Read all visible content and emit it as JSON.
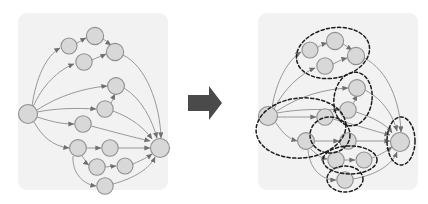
{
  "figure": {
    "title": "",
    "caption": "",
    "type": "graph-transformation-diagram",
    "background_color": "#ffffff",
    "panel_color": "#f2f2f2",
    "node_fill": "#d8d8d8",
    "node_stroke": "#8f8f8f",
    "edge_color": "#8d8d8d",
    "cluster_stroke": "#1d1d1d",
    "block_arrow_color": "#4a4a4a"
  },
  "left_panel": {
    "label": "original-dag",
    "x": 18,
    "y": 13,
    "width": 150,
    "height": 177,
    "radius": 9,
    "nodes": [
      {
        "id": "s",
        "label": "",
        "cx": 28,
        "cy": 114,
        "r": 9.5
      },
      {
        "id": "a1",
        "label": "",
        "cx": 69,
        "cy": 46,
        "r": 8.0
      },
      {
        "id": "a2",
        "label": "",
        "cx": 95,
        "cy": 36,
        "r": 8.6
      },
      {
        "id": "a3",
        "label": "",
        "cx": 84,
        "cy": 62,
        "r": 8.2
      },
      {
        "id": "a4",
        "label": "",
        "cx": 115,
        "cy": 52,
        "r": 8.6
      },
      {
        "id": "b1",
        "label": "",
        "cx": 116,
        "cy": 86,
        "r": 8.4
      },
      {
        "id": "b2",
        "label": "",
        "cx": 105,
        "cy": 109,
        "r": 8.2
      },
      {
        "id": "c1",
        "label": "",
        "cx": 83,
        "cy": 124,
        "r": 8.2
      },
      {
        "id": "d1",
        "label": "",
        "cx": 78,
        "cy": 148,
        "r": 8.4
      },
      {
        "id": "d2",
        "label": "",
        "cx": 110,
        "cy": 148,
        "r": 8.2
      },
      {
        "id": "e1",
        "label": "",
        "cx": 97,
        "cy": 167,
        "r": 8.2
      },
      {
        "id": "e2",
        "label": "",
        "cx": 125,
        "cy": 166,
        "r": 8.0
      },
      {
        "id": "f1",
        "label": "",
        "cx": 105,
        "cy": 186,
        "r": 8.2
      },
      {
        "id": "t",
        "label": "",
        "cx": 160,
        "cy": 148,
        "r": 9.5
      }
    ],
    "edges": [
      {
        "from": "s",
        "to": "a1"
      },
      {
        "from": "s",
        "to": "a3"
      },
      {
        "from": "a1",
        "to": "a2"
      },
      {
        "from": "a2",
        "to": "a4"
      },
      {
        "from": "a3",
        "to": "a4"
      },
      {
        "from": "s",
        "to": "b1"
      },
      {
        "from": "s",
        "to": "b2"
      },
      {
        "from": "b2",
        "to": "b1"
      },
      {
        "from": "s",
        "to": "c1"
      },
      {
        "from": "s",
        "to": "d1"
      },
      {
        "from": "d1",
        "to": "d2"
      },
      {
        "from": "d1",
        "to": "e1"
      },
      {
        "from": "e1",
        "to": "e2"
      },
      {
        "from": "d1",
        "to": "f1"
      },
      {
        "from": "a4",
        "to": "t"
      },
      {
        "from": "b1",
        "to": "t"
      },
      {
        "from": "b2",
        "to": "t"
      },
      {
        "from": "c1",
        "to": "t"
      },
      {
        "from": "d2",
        "to": "t"
      },
      {
        "from": "e2",
        "to": "t"
      },
      {
        "from": "f1",
        "to": "t"
      }
    ]
  },
  "transform_arrow": {
    "label": "transforms-into",
    "x": 188,
    "y": 86,
    "width": 34,
    "height": 34
  },
  "right_panel": {
    "label": "clustered-dag",
    "x": 258,
    "y": 13,
    "width": 160,
    "height": 177,
    "radius": 9,
    "nodes": [
      {
        "id": "s",
        "label": "",
        "cx": 268,
        "cy": 116,
        "r": 9.5
      },
      {
        "id": "a1",
        "label": "",
        "cx": 310,
        "cy": 50,
        "r": 8.0
      },
      {
        "id": "a2",
        "label": "",
        "cx": 335,
        "cy": 41,
        "r": 8.6
      },
      {
        "id": "a3",
        "label": "",
        "cx": 325,
        "cy": 66,
        "r": 8.2
      },
      {
        "id": "a4",
        "label": "",
        "cx": 356,
        "cy": 56,
        "r": 8.6
      },
      {
        "id": "b1",
        "label": "",
        "cx": 357,
        "cy": 88,
        "r": 8.4
      },
      {
        "id": "b2",
        "label": "",
        "cx": 348,
        "cy": 110,
        "r": 8.2
      },
      {
        "id": "c1",
        "label": "",
        "cx": 325,
        "cy": 117,
        "r": 8.2
      },
      {
        "id": "d1",
        "label": "",
        "cx": 306,
        "cy": 141,
        "r": 8.4
      },
      {
        "id": "d2",
        "label": "",
        "cx": 348,
        "cy": 141,
        "r": 8.2
      },
      {
        "id": "e1",
        "label": "",
        "cx": 336,
        "cy": 160,
        "r": 8.2
      },
      {
        "id": "e2",
        "label": "",
        "cx": 364,
        "cy": 160,
        "r": 8.0
      },
      {
        "id": "f1",
        "label": "",
        "cx": 345,
        "cy": 180,
        "r": 8.2
      },
      {
        "id": "t",
        "label": "",
        "cx": 400,
        "cy": 142,
        "r": 9.5
      }
    ],
    "edges": [
      {
        "from": "s",
        "to": "a1"
      },
      {
        "from": "s",
        "to": "a3"
      },
      {
        "from": "a1",
        "to": "a2"
      },
      {
        "from": "a2",
        "to": "a4"
      },
      {
        "from": "a3",
        "to": "a4"
      },
      {
        "from": "s",
        "to": "b1"
      },
      {
        "from": "s",
        "to": "b2"
      },
      {
        "from": "b2",
        "to": "b1"
      },
      {
        "from": "s",
        "to": "c1"
      },
      {
        "from": "s",
        "to": "d1"
      },
      {
        "from": "d1",
        "to": "d2"
      },
      {
        "from": "d1",
        "to": "e1"
      },
      {
        "from": "e1",
        "to": "e2"
      },
      {
        "from": "d1",
        "to": "f1"
      },
      {
        "from": "a4",
        "to": "t"
      },
      {
        "from": "b1",
        "to": "t"
      },
      {
        "from": "b2",
        "to": "t"
      },
      {
        "from": "c1",
        "to": "t"
      },
      {
        "from": "d2",
        "to": "t"
      },
      {
        "from": "e2",
        "to": "t"
      },
      {
        "from": "f1",
        "to": "t"
      }
    ],
    "clusters": [
      {
        "id": "cluster-top",
        "label": "",
        "cx": 333,
        "cy": 53,
        "rx": 37,
        "ry": 25,
        "rotate": -12
      },
      {
        "id": "cluster-mid",
        "label": "",
        "cx": 353,
        "cy": 99,
        "rx": 19,
        "ry": 27,
        "rotate": 8
      },
      {
        "id": "cluster-source",
        "label": "",
        "cx": 301,
        "cy": 128,
        "rx": 45,
        "ry": 30,
        "rotate": -5
      },
      {
        "id": "cluster-lower",
        "label": "",
        "cx": 330,
        "cy": 135,
        "rx": 20,
        "ry": 18,
        "rotate": 0
      },
      {
        "id": "cluster-pair",
        "label": "",
        "cx": 350,
        "cy": 160,
        "rx": 27,
        "ry": 14,
        "rotate": 0
      },
      {
        "id": "cluster-bottom",
        "label": "",
        "cx": 345,
        "cy": 179,
        "rx": 18,
        "ry": 13,
        "rotate": 0
      },
      {
        "id": "cluster-sink",
        "label": "",
        "cx": 401,
        "cy": 141,
        "rx": 14,
        "ry": 24,
        "rotate": 0
      }
    ]
  }
}
